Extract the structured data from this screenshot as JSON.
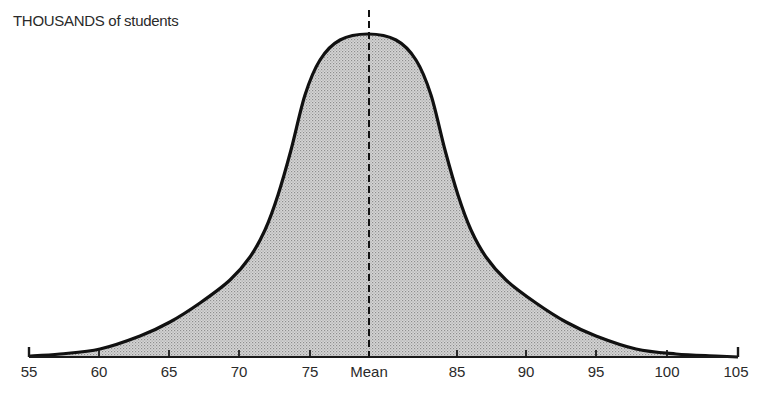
{
  "chart_data": {
    "type": "area",
    "title": "",
    "ylabel": "THOUSANDS of students",
    "xlabel": "",
    "x_ticks": [
      "55",
      "60",
      "65",
      "70",
      "75",
      "Mean",
      "85",
      "90",
      "95",
      "100",
      "105"
    ],
    "x_tick_values": [
      55,
      60,
      65,
      70,
      75,
      80,
      85,
      90,
      95,
      100,
      105
    ],
    "xlim": [
      55,
      105
    ],
    "mean": 80,
    "distribution": "normal (bell curve), symmetric about the mean",
    "annotations": [
      {
        "type": "dashed vertical line",
        "at": "Mean"
      }
    ],
    "grid": false,
    "legend": null,
    "series": [
      {
        "name": "Distribution of students",
        "x": [
          55,
          57.2,
          60,
          62.9,
          65,
          67.1,
          69.3,
          70.7,
          71.8,
          72.7,
          73.6,
          74.6,
          75.7,
          77.1,
          79.1,
          81.1,
          82.5,
          83.6,
          84.6,
          85.5,
          86.4,
          87.5,
          88.9,
          91.0,
          93.1,
          95.0,
          97.9,
          100.8,
          103.6,
          105
        ],
        "relative_height": [
          0.0,
          0.01,
          0.02,
          0.06,
          0.11,
          0.17,
          0.24,
          0.31,
          0.39,
          0.5,
          0.64,
          0.81,
          0.92,
          0.98,
          1.0,
          0.98,
          0.92,
          0.81,
          0.64,
          0.5,
          0.39,
          0.31,
          0.24,
          0.17,
          0.11,
          0.06,
          0.02,
          0.01,
          0.0,
          0.0
        ]
      }
    ]
  },
  "render": {
    "axis_y": 357,
    "points": [
      [
        29,
        356
      ],
      [
        60,
        354
      ],
      [
        100,
        349
      ],
      [
        140,
        336
      ],
      [
        170,
        322
      ],
      [
        200,
        303
      ],
      [
        230,
        280
      ],
      [
        250,
        257
      ],
      [
        265,
        230
      ],
      [
        278,
        195
      ],
      [
        291,
        150
      ],
      [
        305,
        95
      ],
      [
        320,
        60
      ],
      [
        340,
        40
      ],
      [
        368,
        34
      ],
      [
        396,
        40
      ],
      [
        416,
        60
      ],
      [
        431,
        95
      ],
      [
        445,
        150
      ],
      [
        458,
        195
      ],
      [
        471,
        230
      ],
      [
        486,
        257
      ],
      [
        506,
        280
      ],
      [
        536,
        303
      ],
      [
        566,
        322
      ],
      [
        596,
        336
      ],
      [
        636,
        349
      ],
      [
        676,
        354
      ],
      [
        716,
        356
      ],
      [
        738,
        357
      ]
    ],
    "tick_x": [
      29,
      99,
      169,
      239,
      310,
      369,
      457,
      526,
      596,
      667,
      738
    ],
    "mean_x": 369,
    "mean_top": 10,
    "colors": {
      "curve": "#111111",
      "fill": "#c9c9c9",
      "dot": "#8a8a8a",
      "axis": "#1a1a1a",
      "text": "#2a2a2a"
    }
  }
}
